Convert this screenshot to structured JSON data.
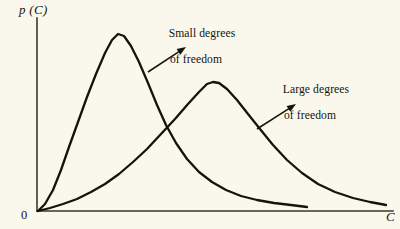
{
  "figure": {
    "background_color": "#faf8ec",
    "ink_color": "#16130e",
    "axis_color": "#3a3630",
    "origin_label": "0",
    "y_axis_label": "p (C)",
    "x_axis_label": "C",
    "annotations": [
      {
        "id": "small-degrees",
        "line1": "Small degrees",
        "line2": "of freedom",
        "arrow_from": [
          148,
          72
        ],
        "arrow_to": [
          186,
          47
        ]
      },
      {
        "id": "large-degrees",
        "line1": "Large degrees",
        "line2": "of freedom",
        "arrow_from": [
          257,
          129
        ],
        "arrow_to": [
          296,
          104
        ]
      }
    ]
  },
  "chart_data": {
    "type": "line",
    "title": "",
    "xlabel": "C",
    "ylabel": "p (C)",
    "grid": false,
    "legend": "annotations",
    "axis_origin_label": "0",
    "xlim": [
      0,
      1
    ],
    "ylim": [
      0,
      1
    ],
    "axis_pixels": {
      "origin": [
        37,
        211
      ],
      "y_axis_top": [
        37,
        18
      ],
      "x_axis_right": [
        393,
        211
      ]
    },
    "series": [
      {
        "name": "Small degrees of freedom",
        "peak_pixel": [
          115,
          33
        ],
        "end_pixel": [
          307,
          207
        ],
        "points": [
          [
            38,
            211
          ],
          [
            45,
            204
          ],
          [
            53,
            190
          ],
          [
            61,
            170
          ],
          [
            69,
            147
          ],
          [
            78,
            122
          ],
          [
            87,
            97
          ],
          [
            96,
            74
          ],
          [
            105,
            53
          ],
          [
            112,
            40
          ],
          [
            118,
            34
          ],
          [
            124,
            36
          ],
          [
            131,
            46
          ],
          [
            139,
            62
          ],
          [
            148,
            83
          ],
          [
            157,
            105
          ],
          [
            166,
            125
          ],
          [
            176,
            143
          ],
          [
            187,
            159
          ],
          [
            199,
            172
          ],
          [
            212,
            182
          ],
          [
            226,
            190
          ],
          [
            241,
            196
          ],
          [
            257,
            200
          ],
          [
            274,
            203
          ],
          [
            291,
            205
          ],
          [
            307,
            207
          ]
        ]
      },
      {
        "name": "Large degrees of freedom",
        "peak_pixel": [
          210,
          82
        ],
        "end_pixel": [
          386,
          205
        ],
        "points": [
          [
            38,
            211
          ],
          [
            50,
            208
          ],
          [
            63,
            204
          ],
          [
            77,
            199
          ],
          [
            91,
            192
          ],
          [
            105,
            184
          ],
          [
            119,
            174
          ],
          [
            133,
            162
          ],
          [
            147,
            149
          ],
          [
            161,
            134
          ],
          [
            175,
            119
          ],
          [
            188,
            104
          ],
          [
            199,
            92
          ],
          [
            207,
            84
          ],
          [
            213,
            82
          ],
          [
            219,
            83
          ],
          [
            227,
            89
          ],
          [
            237,
            100
          ],
          [
            248,
            114
          ],
          [
            260,
            129
          ],
          [
            273,
            145
          ],
          [
            287,
            160
          ],
          [
            302,
            173
          ],
          [
            318,
            184
          ],
          [
            335,
            192
          ],
          [
            353,
            198
          ],
          [
            370,
            202
          ],
          [
            386,
            205
          ]
        ]
      }
    ]
  }
}
